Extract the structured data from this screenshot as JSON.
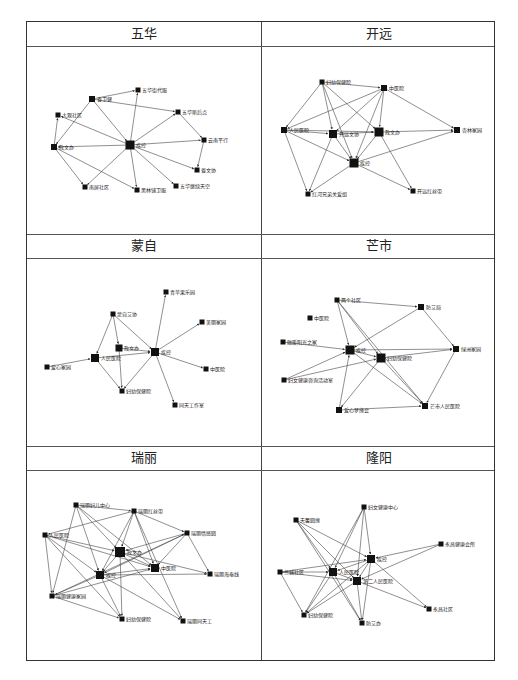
{
  "figure": {
    "panels": [
      {
        "title": "五华",
        "nodes": [
          {
            "id": "jk",
            "label": "疾控",
            "x": 130,
            "y": 145,
            "s": 9
          },
          {
            "id": "ywj",
            "label": "省卫健",
            "x": 92,
            "y": 99,
            "s": 6
          },
          {
            "id": "wh1",
            "label": "五华街代服",
            "x": 138,
            "y": 90,
            "s": 5
          },
          {
            "id": "dg",
            "label": "大观社区",
            "x": 58,
            "y": 115,
            "s": 5
          },
          {
            "id": "wh2",
            "label": "五华斯后点",
            "x": 178,
            "y": 112,
            "s": 5
          },
          {
            "id": "yn",
            "label": "云南平行",
            "x": 204,
            "y": 140,
            "s": 5
          },
          {
            "id": "sw",
            "label": "省文协",
            "x": 197,
            "y": 170,
            "s": 5
          },
          {
            "id": "zw",
            "label": "政文办",
            "x": 54,
            "y": 147,
            "s": 6
          },
          {
            "id": "nn",
            "label": "南屏社区",
            "x": 85,
            "y": 187,
            "s": 5
          },
          {
            "id": "hl",
            "label": "黑林铺卫服",
            "x": 137,
            "y": 190,
            "s": 5
          },
          {
            "id": "wh3",
            "label": "五华继续天空",
            "x": 176,
            "y": 186,
            "s": 5
          }
        ],
        "edges": [
          [
            "ywj",
            "wh1"
          ],
          [
            "ywj",
            "wh2"
          ],
          [
            "ywj",
            "jk"
          ],
          [
            "ywj",
            "zw"
          ],
          [
            "jk",
            "wh1"
          ],
          [
            "jk",
            "wh2"
          ],
          [
            "jk",
            "yn"
          ],
          [
            "jk",
            "sw"
          ],
          [
            "jk",
            "dg"
          ],
          [
            "jk",
            "zw"
          ],
          [
            "jk",
            "nn"
          ],
          [
            "jk",
            "hl"
          ],
          [
            "jk",
            "wh3"
          ],
          [
            "wh2",
            "yn"
          ],
          [
            "yn",
            "sw"
          ],
          [
            "zw",
            "dg"
          ],
          [
            "zw",
            "nn"
          ],
          [
            "zw",
            "hl"
          ]
        ]
      },
      {
        "title": "开远",
        "nodes": [
          {
            "id": "fy",
            "label": "妇幼保健院",
            "x": 322,
            "y": 82,
            "s": 5
          },
          {
            "id": "zy",
            "label": "中医院",
            "x": 384,
            "y": 88,
            "s": 6
          },
          {
            "id": "rm",
            "label": "人民医院",
            "x": 284,
            "y": 130,
            "s": 6
          },
          {
            "id": "kw",
            "label": "开远文协",
            "x": 333,
            "y": 134,
            "s": 8
          },
          {
            "id": "zw",
            "label": "政文办",
            "x": 379,
            "y": 132,
            "s": 9
          },
          {
            "id": "xl",
            "label": "杏林家园",
            "x": 457,
            "y": 130,
            "s": 6
          },
          {
            "id": "jk",
            "label": "疾控",
            "x": 354,
            "y": 163,
            "s": 9
          },
          {
            "id": "hh",
            "label": "红河兄弟关爱组",
            "x": 308,
            "y": 194,
            "s": 5
          },
          {
            "id": "kh",
            "label": "开远红丝带",
            "x": 413,
            "y": 191,
            "s": 5
          }
        ],
        "edges": [
          [
            "fy",
            "zy"
          ],
          [
            "fy",
            "rm"
          ],
          [
            "fy",
            "kw"
          ],
          [
            "fy",
            "jk"
          ],
          [
            "fy",
            "zw"
          ],
          [
            "zy",
            "rm"
          ],
          [
            "zy",
            "kw"
          ],
          [
            "zy",
            "zw"
          ],
          [
            "zy",
            "jk"
          ],
          [
            "zy",
            "xl"
          ],
          [
            "rm",
            "kw"
          ],
          [
            "rm",
            "zw"
          ],
          [
            "rm",
            "jk"
          ],
          [
            "rm",
            "hh"
          ],
          [
            "kw",
            "zw"
          ],
          [
            "kw",
            "jk"
          ],
          [
            "kw",
            "hh"
          ],
          [
            "zw",
            "xl"
          ],
          [
            "zw",
            "jk"
          ],
          [
            "zw",
            "kh"
          ],
          [
            "jk",
            "xl"
          ],
          [
            "jk",
            "kh"
          ],
          [
            "jk",
            "hh"
          ]
        ]
      },
      {
        "title": "蒙自",
        "nodes": [
          {
            "id": "qh",
            "label": "青苹果乐园",
            "x": 166,
            "y": 292,
            "s": 5
          },
          {
            "id": "ml",
            "label": "蒙自艾协",
            "x": 113,
            "y": 314,
            "s": 5
          },
          {
            "id": "xs",
            "label": "美丽家园",
            "x": 202,
            "y": 322,
            "s": 5
          },
          {
            "id": "zw",
            "label": "政文办",
            "x": 119,
            "y": 348,
            "s": 7
          },
          {
            "id": "jk",
            "label": "疾控",
            "x": 155,
            "y": 352,
            "s": 8
          },
          {
            "id": "rm",
            "label": "人民医院",
            "x": 95,
            "y": 358,
            "s": 8
          },
          {
            "id": "ax",
            "label": "爱心家园",
            "x": 47,
            "y": 367,
            "s": 5
          },
          {
            "id": "zy",
            "label": "中医院",
            "x": 206,
            "y": 369,
            "s": 5
          },
          {
            "id": "fy",
            "label": "妇幼保健院",
            "x": 122,
            "y": 391,
            "s": 5
          },
          {
            "id": "ty",
            "label": "同天工作室",
            "x": 175,
            "y": 405,
            "s": 5
          }
        ],
        "edges": [
          [
            "ml",
            "rm"
          ],
          [
            "ml",
            "zw"
          ],
          [
            "ml",
            "jk"
          ],
          [
            "zw",
            "jk"
          ],
          [
            "zw",
            "fy"
          ],
          [
            "rm",
            "jk"
          ],
          [
            "rm",
            "fy"
          ],
          [
            "ax",
            "rm"
          ],
          [
            "jk",
            "qh"
          ],
          [
            "jk",
            "xs"
          ],
          [
            "jk",
            "zy"
          ],
          [
            "jk",
            "ty"
          ],
          [
            "jk",
            "fy"
          ]
        ]
      },
      {
        "title": "芒市",
        "nodes": [
          {
            "id": "lq",
            "label": "两个社区",
            "x": 337,
            "y": 300,
            "s": 5
          },
          {
            "id": "fwj",
            "label": "防艾局",
            "x": 421,
            "y": 307,
            "s": 6
          },
          {
            "id": "zy",
            "label": "中医院",
            "x": 310,
            "y": 318,
            "s": 5
          },
          {
            "id": "rh",
            "label": "融暖阳光之家",
            "x": 283,
            "y": 342,
            "s": 5
          },
          {
            "id": "jk",
            "label": "疾控",
            "x": 350,
            "y": 350,
            "s": 9
          },
          {
            "id": "fy",
            "label": "妇幼保健院",
            "x": 381,
            "y": 358,
            "s": 9
          },
          {
            "id": "ly",
            "label": "绿洲家园",
            "x": 456,
            "y": 349,
            "s": 6
          },
          {
            "id": "fn",
            "label": "妇女健康咨询活动室",
            "x": 284,
            "y": 380,
            "s": 5
          },
          {
            "id": "ax",
            "label": "爱心梦缘会",
            "x": 339,
            "y": 410,
            "s": 6
          },
          {
            "id": "ms",
            "label": "芒市人民医院",
            "x": 425,
            "y": 406,
            "s": 6
          }
        ],
        "edges": [
          [
            "lq",
            "fwj"
          ],
          [
            "lq",
            "jk"
          ],
          [
            "lq",
            "fy"
          ],
          [
            "lq",
            "ms"
          ],
          [
            "fwj",
            "jk"
          ],
          [
            "fwj",
            "ly"
          ],
          [
            "rh",
            "jk"
          ],
          [
            "jk",
            "fy"
          ],
          [
            "jk",
            "ly"
          ],
          [
            "jk",
            "ms"
          ],
          [
            "fn",
            "jk"
          ],
          [
            "fn",
            "fy"
          ],
          [
            "fy",
            "ly"
          ],
          [
            "fy",
            "ax"
          ],
          [
            "fy",
            "ms"
          ],
          [
            "ax",
            "jk"
          ],
          [
            "ax",
            "ms"
          ],
          [
            "ly",
            "ms"
          ]
        ]
      },
      {
        "title": "瑞丽",
        "nodes": [
          {
            "id": "fy1",
            "label": "瑞丽妇儿中心",
            "x": 76,
            "y": 505,
            "s": 5
          },
          {
            "id": "hs",
            "label": "瑞丽红丝带",
            "x": 134,
            "y": 511,
            "s": 5
          },
          {
            "id": "rm",
            "label": "人民医院",
            "x": 45,
            "y": 535,
            "s": 5
          },
          {
            "id": "qx",
            "label": "瑞丽情感圆",
            "x": 187,
            "y": 533,
            "s": 5
          },
          {
            "id": "zw",
            "label": "政文办",
            "x": 120,
            "y": 552,
            "s": 10
          },
          {
            "id": "zy",
            "label": "中医院",
            "x": 155,
            "y": 568,
            "s": 8
          },
          {
            "id": "jk",
            "label": "疾控",
            "x": 100,
            "y": 575,
            "s": 8
          },
          {
            "id": "hd",
            "label": "瑞丽海泰线",
            "x": 210,
            "y": 574,
            "s": 5
          },
          {
            "id": "jz",
            "label": "瑞丽健康家园",
            "x": 52,
            "y": 596,
            "s": 5
          },
          {
            "id": "fy2",
            "label": "妇幼保健院",
            "x": 122,
            "y": 619,
            "s": 5
          },
          {
            "id": "tw",
            "label": "瑞丽同天工",
            "x": 183,
            "y": 621,
            "s": 5
          }
        ],
        "edges": [
          [
            "fy1",
            "hs"
          ],
          [
            "fy1",
            "jk"
          ],
          [
            "fy1",
            "zw"
          ],
          [
            "fy1",
            "zy"
          ],
          [
            "fy1",
            "jz"
          ],
          [
            "hs",
            "rm"
          ],
          [
            "hs",
            "zw"
          ],
          [
            "hs",
            "jk"
          ],
          [
            "hs",
            "qx"
          ],
          [
            "hs",
            "zy"
          ],
          [
            "hs",
            "tw"
          ],
          [
            "rm",
            "zw"
          ],
          [
            "rm",
            "jk"
          ],
          [
            "rm",
            "jz"
          ],
          [
            "rm",
            "fy2"
          ],
          [
            "rm",
            "zy"
          ],
          [
            "qx",
            "zw"
          ],
          [
            "qx",
            "jk"
          ],
          [
            "qx",
            "hd"
          ],
          [
            "qx",
            "zy"
          ],
          [
            "zw",
            "zy"
          ],
          [
            "zw",
            "jk"
          ],
          [
            "zw",
            "hd"
          ],
          [
            "zw",
            "fy2"
          ],
          [
            "zw",
            "tw"
          ],
          [
            "jk",
            "zy"
          ],
          [
            "jk",
            "hd"
          ],
          [
            "jk",
            "jz"
          ],
          [
            "jk",
            "fy2"
          ],
          [
            "jk",
            "tw"
          ],
          [
            "jz",
            "fy2"
          ],
          [
            "jz",
            "zy"
          ],
          [
            "jz",
            "qx"
          ]
        ]
      },
      {
        "title": "隆阳",
        "nodes": [
          {
            "id": "fn",
            "label": "妇女健康中心",
            "x": 364,
            "y": 507,
            "s": 5
          },
          {
            "id": "tx",
            "label": "天馨圆缘",
            "x": 296,
            "y": 520,
            "s": 5
          },
          {
            "id": "yj",
            "label": "永昌健康会所",
            "x": 441,
            "y": 544,
            "s": 5
          },
          {
            "id": "jk",
            "label": "疾控",
            "x": 371,
            "y": 559,
            "s": 8
          },
          {
            "id": "rm",
            "label": "人民医院",
            "x": 333,
            "y": 572,
            "s": 8
          },
          {
            "id": "lc",
            "label": "兰城社区",
            "x": 280,
            "y": 572,
            "s": 5
          },
          {
            "id": "de",
            "label": "第二人民医院",
            "x": 357,
            "y": 581,
            "s": 8
          },
          {
            "id": "yc",
            "label": "永昌社区",
            "x": 429,
            "y": 609,
            "s": 5
          },
          {
            "id": "fy",
            "label": "妇幼保健院",
            "x": 304,
            "y": 615,
            "s": 5
          },
          {
            "id": "fa",
            "label": "防艾办",
            "x": 362,
            "y": 623,
            "s": 5
          }
        ],
        "edges": [
          [
            "fn",
            "jk"
          ],
          [
            "fn",
            "rm"
          ],
          [
            "fn",
            "de"
          ],
          [
            "fn",
            "fy"
          ],
          [
            "tx",
            "jk"
          ],
          [
            "tx",
            "rm"
          ],
          [
            "tx",
            "de"
          ],
          [
            "tx",
            "fa"
          ],
          [
            "yj",
            "jk"
          ],
          [
            "yj",
            "de"
          ],
          [
            "jk",
            "rm"
          ],
          [
            "jk",
            "de"
          ],
          [
            "jk",
            "yc"
          ],
          [
            "jk",
            "fy"
          ],
          [
            "jk",
            "fa"
          ],
          [
            "lc",
            "rm"
          ],
          [
            "lc",
            "jk"
          ],
          [
            "lc",
            "de"
          ],
          [
            "lc",
            "fy"
          ],
          [
            "rm",
            "de"
          ],
          [
            "rm",
            "fy"
          ],
          [
            "rm",
            "fa"
          ],
          [
            "de",
            "yc"
          ],
          [
            "de",
            "fy"
          ],
          [
            "de",
            "fa"
          ]
        ]
      }
    ]
  }
}
